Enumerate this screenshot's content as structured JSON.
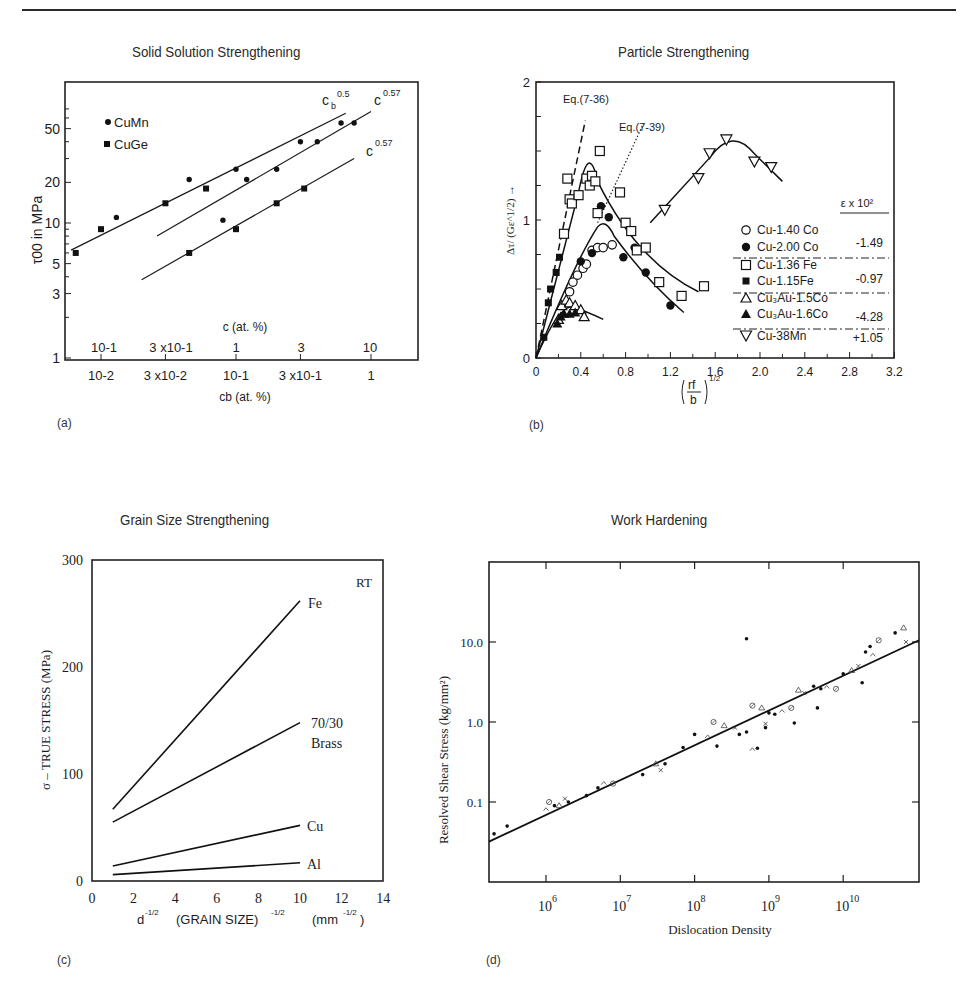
{
  "page": {
    "panels": [
      {
        "id": "a",
        "label": "(a)",
        "title": "Solid Solution Strengthening"
      },
      {
        "id": "b",
        "label": "(b)",
        "title": "Particle Strengthening"
      },
      {
        "id": "c",
        "label": "(c)",
        "title": "Grain Size Strengthening"
      },
      {
        "id": "d",
        "label": "(d)",
        "title": "Work Hardening"
      }
    ]
  },
  "chart_data": [
    {
      "id": "a",
      "type": "scatter",
      "title": "Solid Solution Strengthening",
      "ylabel": "τ00 in MPa",
      "xlabel": "cb (at. %)",
      "xlabel_top": "c (at. %)",
      "yscale": "log",
      "xscale": "log",
      "yticks": [
        1,
        3,
        5,
        10,
        20,
        50
      ],
      "ytick_labels": [
        "1",
        "3",
        "5",
        "10",
        "20",
        "50"
      ],
      "xticks_bottom_labels": [
        "10-2",
        "3 x10-2",
        "10-1",
        "3 x10-1",
        "1"
      ],
      "xticks_top_labels": [
        "10-1",
        "3 x10-1",
        "1",
        "3",
        "10"
      ],
      "legend": [
        "CuMn",
        "CuGe"
      ],
      "series": [
        {
          "name": "CuMn",
          "marker": "circle",
          "points": [
            [
              0.013,
              11
            ],
            [
              0.045,
              21
            ],
            [
              0.1,
              25
            ],
            [
              0.2,
              25
            ],
            [
              0.3,
              40
            ],
            [
              0.6,
              55
            ],
            [
              0.08,
              10.5
            ],
            [
              0.12,
              21
            ],
            [
              0.4,
              40
            ],
            [
              0.75,
              55
            ]
          ]
        },
        {
          "name": "CuGe",
          "marker": "square",
          "points": [
            [
              0.0065,
              6
            ],
            [
              0.01,
              9
            ],
            [
              0.03,
              14
            ],
            [
              0.06,
              18
            ],
            [
              0.045,
              6
            ],
            [
              0.1,
              9
            ],
            [
              0.2,
              14
            ],
            [
              0.32,
              18
            ]
          ]
        }
      ],
      "fit_lines": [
        {
          "label": "cb^0.5",
          "from": [
            0.006,
            6.3
          ],
          "to": [
            0.65,
            65
          ]
        },
        {
          "label": "c^0.57",
          "from": [
            0.026,
            8
          ],
          "to": [
            1.0,
            67
          ]
        },
        {
          "label": "c^0.57",
          "from": [
            0.02,
            3.8
          ],
          "to": [
            0.75,
            30
          ]
        }
      ],
      "annotations": [
        "cb^0.5",
        "c^0.57",
        "c^0.57"
      ]
    },
    {
      "id": "b",
      "type": "scatter",
      "title": "Particle Strengthening",
      "ylabel": "Δτ/ (Gε^1/2) →",
      "xlabel": "(rf/b)^1/2",
      "xlim": [
        0,
        3.2
      ],
      "ylim": [
        0,
        2
      ],
      "xticks": [
        0,
        0.4,
        0.8,
        1.2,
        1.6,
        2.0,
        2.4,
        2.8,
        3.2
      ],
      "xtick_labels": [
        "0",
        "0.4",
        "0.8",
        "1.2",
        "1.6",
        "2.0",
        "2.4",
        "2.8",
        "3.2"
      ],
      "yticks": [
        0,
        1,
        2
      ],
      "ytick_labels": [
        "0",
        "1",
        "2"
      ],
      "annotations": [
        "Eq.(7-36)",
        "Eq.(7-39)"
      ],
      "legend_header": "ε x 10²",
      "legend": [
        {
          "name": "Cu-1.40 Co",
          "marker": "open-circle"
        },
        {
          "name": "Cu-2.00 Co",
          "marker": "filled-circle"
        },
        {
          "name": "Cu-1.36 Fe",
          "marker": "open-square"
        },
        {
          "name": "Cu-1.15Fe",
          "marker": "filled-square"
        },
        {
          "name": "Cu₃Au-1.5Co",
          "marker": "open-triangle"
        },
        {
          "name": "Cu₃Au-1.6Co",
          "marker": "filled-triangle"
        },
        {
          "name": "Cu-38Mn",
          "marker": "open-inverted-triangle"
        }
      ],
      "epsilon_values": [
        "-1.49",
        "-0.97",
        "-4.28",
        "+1.05"
      ],
      "series": [
        {
          "name": "Cu-1.40 Co",
          "points": [
            [
              0.3,
              0.48
            ],
            [
              0.33,
              0.55
            ],
            [
              0.37,
              0.6
            ],
            [
              0.42,
              0.65
            ],
            [
              0.45,
              0.68
            ],
            [
              0.5,
              0.78
            ],
            [
              0.55,
              0.8
            ],
            [
              0.6,
              0.8
            ],
            [
              0.68,
              0.82
            ]
          ]
        },
        {
          "name": "Cu-2.00 Co",
          "points": [
            [
              0.4,
              0.7
            ],
            [
              0.5,
              0.76
            ],
            [
              0.58,
              1.1
            ],
            [
              0.65,
              1.02
            ],
            [
              0.78,
              0.73
            ],
            [
              0.88,
              0.8
            ],
            [
              0.98,
              0.62
            ],
            [
              1.2,
              0.38
            ]
          ]
        },
        {
          "name": "Cu-1.36 Fe",
          "points": [
            [
              0.25,
              0.9
            ],
            [
              0.28,
              1.3
            ],
            [
              0.3,
              1.15
            ],
            [
              0.32,
              1.12
            ],
            [
              0.38,
              1.18
            ],
            [
              0.45,
              1.3
            ],
            [
              0.48,
              1.25
            ],
            [
              0.5,
              1.32
            ],
            [
              0.53,
              1.28
            ],
            [
              0.55,
              1.05
            ],
            [
              0.57,
              1.5
            ],
            [
              0.75,
              1.2
            ],
            [
              0.8,
              0.98
            ],
            [
              0.85,
              0.92
            ],
            [
              0.9,
              0.78
            ],
            [
              0.98,
              0.8
            ],
            [
              1.1,
              0.55
            ],
            [
              1.3,
              0.45
            ],
            [
              1.5,
              0.52
            ]
          ]
        },
        {
          "name": "Cu-1.15Fe",
          "points": [
            [
              0.07,
              0.15
            ],
            [
              0.11,
              0.4
            ],
            [
              0.13,
              0.5
            ],
            [
              0.18,
              0.62
            ],
            [
              0.21,
              0.73
            ]
          ]
        },
        {
          "name": "Cu₃Au-1.5Co",
          "points": [
            [
              0.2,
              0.28
            ],
            [
              0.23,
              0.38
            ],
            [
              0.27,
              0.42
            ],
            [
              0.3,
              0.4
            ],
            [
              0.35,
              0.38
            ],
            [
              0.4,
              0.35
            ],
            [
              0.43,
              0.3
            ]
          ]
        },
        {
          "name": "Cu₃Au-1.6Co",
          "points": [
            [
              0.19,
              0.25
            ],
            [
              0.22,
              0.3
            ],
            [
              0.25,
              0.32
            ],
            [
              0.3,
              0.32
            ],
            [
              0.35,
              0.33
            ]
          ]
        },
        {
          "name": "Cu-38Mn",
          "points": [
            [
              1.15,
              1.07
            ],
            [
              1.45,
              1.3
            ],
            [
              1.55,
              1.48
            ],
            [
              1.7,
              1.58
            ],
            [
              1.95,
              1.42
            ],
            [
              2.1,
              1.38
            ]
          ]
        }
      ]
    },
    {
      "id": "c",
      "type": "line",
      "title": "Grain Size Strengthening",
      "xlabel": "d^-1/2 (GRAIN SIZE)^-1/2 (mm^-1/2)",
      "ylabel": "σ – TRUE STRESS (MPa)",
      "xlim": [
        0,
        14
      ],
      "ylim": [
        0,
        300
      ],
      "xticks": [
        0,
        2,
        4,
        6,
        8,
        10,
        12,
        14
      ],
      "yticks": [
        0,
        100,
        200,
        300
      ],
      "annotations": [
        "RT"
      ],
      "series": [
        {
          "name": "Fe",
          "x": [
            1,
            10
          ],
          "values": [
            67,
            262
          ]
        },
        {
          "name": "70/30 Brass",
          "x": [
            1,
            10
          ],
          "values": [
            55,
            148
          ]
        },
        {
          "name": "Cu",
          "x": [
            1,
            10
          ],
          "values": [
            14,
            52
          ]
        },
        {
          "name": "Al",
          "x": [
            1,
            10
          ],
          "values": [
            6,
            17
          ]
        }
      ]
    },
    {
      "id": "d",
      "type": "scatter",
      "title": "Work Hardening",
      "xlabel": "Dislocation Density",
      "ylabel": "Resolved Shear Stress (kg/mm²)",
      "xscale": "log",
      "yscale": "log",
      "xticks": [
        "10^6",
        "10^7",
        "10^8",
        "10^9",
        "10^10"
      ],
      "yticks": [
        "0.1",
        "1.0",
        "10.0"
      ],
      "fit_line": {
        "from": [
          150000.0,
          0.032
        ],
        "to": [
          70000000000.0,
          10.5
        ]
      },
      "points": [
        [
          200000.0,
          0.04
        ],
        [
          300000.0,
          0.05
        ],
        [
          1000000.0,
          0.08
        ],
        [
          1100000.0,
          0.1
        ],
        [
          1300000.0,
          0.09
        ],
        [
          1500000.0,
          0.09
        ],
        [
          1800000.0,
          0.11
        ],
        [
          2000000.0,
          0.1
        ],
        [
          3500000.0,
          0.12
        ],
        [
          5000000.0,
          0.15
        ],
        [
          6000000.0,
          0.17
        ],
        [
          8000000.0,
          0.17
        ],
        [
          20000000.0,
          0.22
        ],
        [
          30000000.0,
          0.3
        ],
        [
          35000000.0,
          0.25
        ],
        [
          40000000.0,
          0.3
        ],
        [
          70000000.0,
          0.48
        ],
        [
          100000000.0,
          0.7
        ],
        [
          150000000.0,
          0.65
        ],
        [
          180000000.0,
          1.0
        ],
        [
          200000000.0,
          0.5
        ],
        [
          250000000.0,
          0.9
        ],
        [
          350000000.0,
          0.85
        ],
        [
          400000000.0,
          0.7
        ],
        [
          500000000.0,
          0.75
        ],
        [
          500000000.0,
          11
        ],
        [
          600000000.0,
          0.45
        ],
        [
          600000000.0,
          1.6
        ],
        [
          700000000.0,
          0.47
        ],
        [
          800000000.0,
          1.5
        ],
        [
          900000000.0,
          0.95
        ],
        [
          900000000.0,
          0.85
        ],
        [
          1000000000.0,
          1.3
        ],
        [
          1200000000.0,
          1.25
        ],
        [
          1500000000.0,
          1.35
        ],
        [
          2000000000.0,
          1.5
        ],
        [
          2200000000.0,
          0.97
        ],
        [
          2500000000.0,
          2.5
        ],
        [
          3000000000.0,
          2.3
        ],
        [
          4000000000.0,
          2.8
        ],
        [
          4500000000.0,
          1.5
        ],
        [
          5000000000.0,
          2.6
        ],
        [
          6000000000.0,
          2.7
        ],
        [
          8000000000.0,
          2.6
        ],
        [
          10000000000.0,
          4
        ],
        [
          13000000000.0,
          4.4
        ],
        [
          16000000000.0,
          5
        ],
        [
          18000000000.0,
          3.1
        ],
        [
          20000000000.0,
          7.5
        ],
        [
          23000000000.0,
          8.8
        ],
        [
          25000000000.0,
          6.8
        ],
        [
          30000000000.0,
          10.5
        ],
        [
          50000000000.0,
          13
        ],
        [
          65000000000.0,
          15
        ],
        [
          70000000000.0,
          10
        ]
      ]
    }
  ]
}
